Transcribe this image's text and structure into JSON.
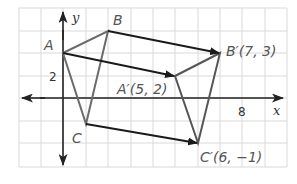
{
  "axes": {
    "x_label": "x",
    "y_label": "y",
    "x_tick": "8",
    "y_tick": "2"
  },
  "points": {
    "A": {
      "label": "A",
      "coords": [
        0,
        3
      ]
    },
    "B": {
      "label": "B",
      "coords": [
        2,
        4
      ]
    },
    "C": {
      "label": "C",
      "coords": [
        1,
        0
      ]
    },
    "A_prime": {
      "label": "A′(5, 2)",
      "coords": [
        5,
        2
      ]
    },
    "B_prime": {
      "label": "B′(7, 3)",
      "coords": [
        7,
        3
      ]
    },
    "C_prime": {
      "label": "C′(6, −1)",
      "coords": [
        6,
        -1
      ]
    }
  },
  "colors": {
    "grid": "#d9d9d9",
    "axis": "#222222",
    "triangle": "#6b6b6b",
    "translation_arrow": "#1a1a1a"
  }
}
